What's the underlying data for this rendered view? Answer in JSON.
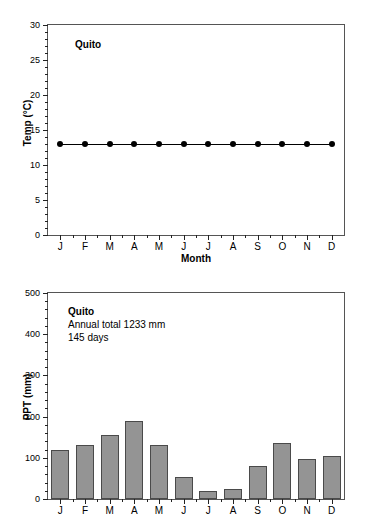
{
  "figure": {
    "station": "Quito"
  },
  "chart_data": [
    {
      "id": "temperature",
      "type": "line",
      "title": "Quito",
      "xlabel": "Month",
      "ylabel": "Temp (°C)",
      "categories": [
        "J",
        "F",
        "M",
        "A",
        "M",
        "J",
        "J",
        "A",
        "S",
        "O",
        "N",
        "D"
      ],
      "values": [
        13,
        13,
        13,
        13,
        13,
        13,
        13,
        13,
        13,
        13,
        13,
        13
      ],
      "ylim": [
        0,
        30
      ],
      "ytick_values": [
        0,
        5,
        10,
        15,
        20,
        25,
        30
      ],
      "ytick_labels": [
        "0",
        "5",
        "10",
        "15",
        "20",
        "25",
        "30"
      ],
      "yminor_step": 1,
      "grid": false,
      "legend": "none",
      "marker": "filled-circle",
      "annotations": [
        {
          "text": "Quito",
          "bold": true
        }
      ]
    },
    {
      "id": "precipitation",
      "type": "bar",
      "title": "Quito",
      "xlabel": "",
      "ylabel": "PPT (mm)",
      "categories": [
        "J",
        "F",
        "M",
        "A",
        "M",
        "J",
        "J",
        "A",
        "S",
        "O",
        "N",
        "D"
      ],
      "values": [
        120,
        130,
        156,
        189,
        130,
        54,
        20,
        25,
        80,
        135,
        98,
        104
      ],
      "ylim": [
        0,
        500
      ],
      "ytick_values": [
        0,
        100,
        200,
        300,
        400,
        500
      ],
      "ytick_labels": [
        "0",
        "100",
        "200",
        "300",
        "400",
        "500"
      ],
      "yminor_step": 20,
      "grid": false,
      "legend": "none",
      "bar_color": "#949494",
      "bar_edge_color": "#4a4a4a",
      "annotations": [
        {
          "text": "Quito",
          "bold": true
        },
        {
          "text": "Annual total 1233 mm",
          "bold": false
        },
        {
          "text": "145 days",
          "bold": false
        }
      ]
    }
  ],
  "temperature_panel": {
    "note_line_1": "Quito",
    "y_axis_title": "Temp (°C)",
    "x_axis_title": "Month"
  },
  "precipitation_panel": {
    "note_line_1": "Quito",
    "note_line_2": "Annual total 1233 mm",
    "note_line_3": "145 days",
    "y_axis_title": "PPT (mm)"
  }
}
